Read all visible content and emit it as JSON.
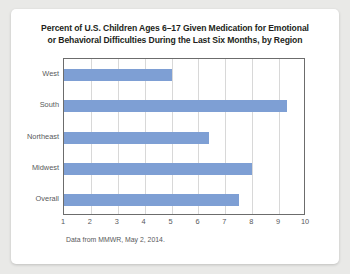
{
  "card": {
    "source_note": "Data from MMWR, May 2, 2014."
  },
  "chart_data": {
    "type": "bar",
    "orientation": "horizontal",
    "title": "Percent of U.S. Children Ages 6–17 Given Medication for Emotional or Behavioral Difficulties During the Last Six Months, by Region",
    "title_line1": "Percent of U.S. Children Ages 6–17 Given Medication for Emotional",
    "title_line2": "or Behavioral Difficulties During the Last Six Months, by Region",
    "categories": [
      "West",
      "South",
      "Northeast",
      "Midwest",
      "Overall"
    ],
    "values": [
      5.0,
      9.3,
      6.4,
      8.0,
      7.5
    ],
    "xlabel": "",
    "ylabel": "",
    "xlim": [
      1,
      10
    ],
    "xticks": [
      1,
      2,
      3,
      4,
      5,
      6,
      7,
      8,
      9,
      10
    ],
    "xtick_labels": [
      "1",
      "2",
      "3",
      "4",
      "5",
      "6",
      "7",
      "8",
      "9",
      "10"
    ],
    "grid": "vertical",
    "legend": "none",
    "bar_color": "#7e9fd4",
    "frame_color": "#6c6c6c",
    "gridline_color": "#d8d8d8",
    "text_color": "#58595b",
    "title_color": "#231f20",
    "source": "Data from MMWR, May 2, 2014."
  }
}
